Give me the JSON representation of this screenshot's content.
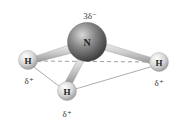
{
  "atoms": {
    "nitrogen": {
      "symbol": "N",
      "charge": "3δ⁻",
      "color": "#6e6e6e"
    },
    "h_left": {
      "symbol": "H",
      "charge": "δ⁺",
      "color": "#dcdcdc"
    },
    "h_bottom": {
      "symbol": "H",
      "charge": "δ⁺",
      "color": "#dcdcdc"
    },
    "h_right": {
      "symbol": "H",
      "charge": "δ⁺",
      "color": "#dcdcdc"
    }
  },
  "lines": {
    "dashed": "H-left to H-right (back edge of base)",
    "solid": [
      "H-left to H-bottom",
      "H-bottom to H-right"
    ]
  }
}
